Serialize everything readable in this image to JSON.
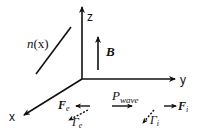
{
  "diagram": {
    "axes": {
      "x_label": "x",
      "y_label": "y",
      "z_label": "z"
    },
    "density_gradient": {
      "label_main": "n",
      "label_arg": "(x)"
    },
    "magnetic_field": {
      "label": "B"
    },
    "wave_power": {
      "label_main": "P",
      "label_sub": "wave"
    },
    "electron_force": {
      "label_main": "F",
      "label_sub": "e"
    },
    "ion_force": {
      "label_main": "F",
      "label_sub": "i"
    },
    "electron_flux": {
      "label_main": "Γ",
      "label_sub": "e"
    },
    "ion_flux": {
      "label_main": "Γ",
      "label_sub": "i"
    },
    "colors": {
      "ink": "#111111",
      "background": "#ffffff"
    }
  }
}
